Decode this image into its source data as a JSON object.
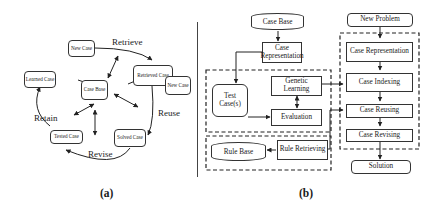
{
  "panel_a": {
    "label": "(a)",
    "nodes": {
      "new_case": "New Case",
      "retrieved_case": "Retrieved Case",
      "new_case_2": "New Case",
      "learned_case": "Learned Case",
      "case_base": "Case Base",
      "tested_case": "Tested Case",
      "solved_case": "Solved Case"
    },
    "edges": {
      "retrieve": "Retrieve",
      "reuse": "Reuse",
      "revise": "Revise",
      "retain": "Retain"
    }
  },
  "panel_b": {
    "label": "(b)",
    "left": {
      "case_base": "Case Base",
      "case_representation": "Case Representation",
      "test_cases": "Test Case(s)",
      "genetic_learning": "Genetic Learning",
      "evaluation": "Evaluation",
      "rule_base": "Rule Base",
      "rule_retrieving": "Rule Retrieving"
    },
    "right": {
      "new_problem": "New Problem",
      "case_representation": "Case Representation",
      "case_indexing": "Case Indexing",
      "case_reusing": "Case Reusing",
      "case_revising": "Case Revising",
      "solution": "Solution"
    }
  }
}
